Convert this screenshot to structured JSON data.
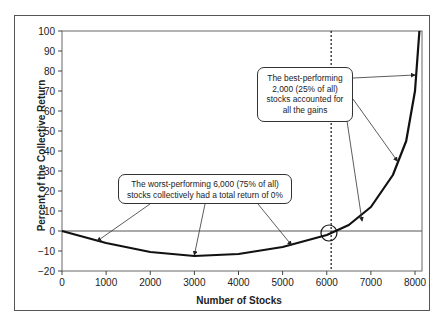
{
  "chart_data": {
    "type": "line",
    "title": "",
    "xlabel": "Number of Stocks",
    "ylabel": "Percent of the Collective Return",
    "xlim": [
      0,
      8000
    ],
    "ylim": [
      -20,
      100
    ],
    "xticks": [
      0,
      1000,
      2000,
      3000,
      4000,
      5000,
      6000,
      7000,
      8000
    ],
    "yticks": [
      -20,
      -10,
      0,
      10,
      20,
      30,
      40,
      50,
      60,
      70,
      80,
      90,
      100
    ],
    "grid": false,
    "series": [
      {
        "name": "Cumulative collective return",
        "x": [
          0,
          1000,
          2000,
          3000,
          4000,
          5000,
          6000,
          6500,
          7000,
          7500,
          7800,
          8000,
          8100
        ],
        "y": [
          0,
          -6,
          -10.5,
          -12.5,
          -11.5,
          -8,
          -2,
          3,
          12,
          28,
          45,
          70,
          100
        ]
      }
    ],
    "reference_lines": [
      {
        "type": "horizontal",
        "y": 0
      },
      {
        "type": "vertical",
        "x": 6100,
        "style": "dotted"
      }
    ],
    "annotations": [
      {
        "text": "The worst-performing 6,000 (75% of all) stocks collectively had a total return of 0%",
        "arrows_to": [
          [
            800,
            -5
          ],
          [
            3000,
            -12
          ],
          [
            5200,
            -7
          ]
        ]
      },
      {
        "text": "The best-performing 2,000 (25% of all) stocks accounted for all the gains",
        "arrows_to": [
          [
            8000,
            78
          ],
          [
            7600,
            35
          ],
          [
            6800,
            5
          ]
        ]
      },
      {
        "text": "circle marker at crossing",
        "at": [
          6050,
          -1
        ]
      }
    ]
  },
  "labels": {
    "xlabel": "Number of Stocks",
    "ylabel": "Percent of the Collective Return",
    "callout_worst": "The worst-performing 6,000 (75% of all) stocks collectively had a total return of 0%",
    "callout_best": "The best-performing 2,000 (25% of all) stocks accounted for all the gains"
  }
}
